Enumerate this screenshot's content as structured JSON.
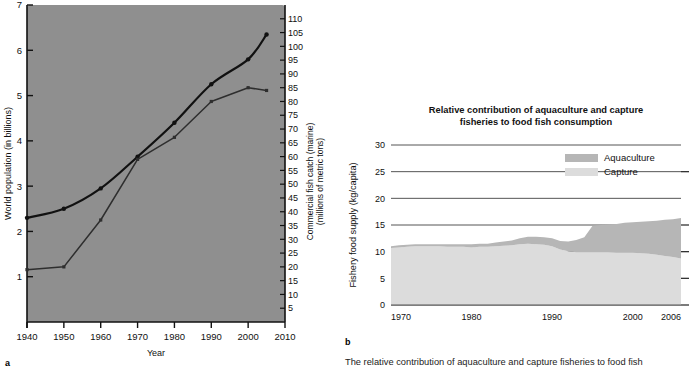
{
  "figure": {
    "panel_a_letter": "a",
    "panel_b_letter": "b",
    "caption": "The relative contribution of aquaculture and capture fisheries to food fish"
  },
  "chart_data": [
    {
      "id": "panel-a",
      "type": "line",
      "title": "",
      "xlabel": "Year",
      "ylabel": "World population (in billions)",
      "y2label": "Commercial fish catch (marine) (millions of metric tons)",
      "xlim": [
        1940,
        2010
      ],
      "ylim": [
        0,
        7
      ],
      "y2lim": [
        0,
        115
      ],
      "xticks": [
        1940,
        1950,
        1960,
        1970,
        1980,
        1990,
        2000,
        2010
      ],
      "yticks": [
        1,
        2,
        3,
        4,
        5,
        6,
        7
      ],
      "y2ticks": [
        5,
        10,
        15,
        20,
        25,
        30,
        35,
        40,
        45,
        50,
        55,
        60,
        65,
        70,
        75,
        80,
        85,
        90,
        95,
        100,
        105,
        110
      ],
      "grid": false,
      "legend": "none",
      "plot_background": "#8f8f8f",
      "series": [
        {
          "name": "World population",
          "axis": "left",
          "color": "#111111",
          "x": [
            1940,
            1950,
            1960,
            1970,
            1980,
            1990,
            2000,
            2005
          ],
          "values": [
            2.3,
            2.5,
            2.95,
            3.65,
            4.4,
            5.25,
            5.8,
            6.35
          ]
        },
        {
          "name": "Commercial fish catch (marine)",
          "axis": "right",
          "color": "#2e2e2e",
          "x": [
            1940,
            1950,
            1960,
            1970,
            1980,
            1990,
            2000,
            2005
          ],
          "values": [
            19,
            20,
            37,
            59,
            67,
            80,
            85,
            84
          ]
        }
      ]
    },
    {
      "id": "panel-b",
      "type": "area",
      "title": "Relative contribution of aquaculture and capture fisheries to food fish consumption",
      "xlabel": "",
      "ylabel": "Fishery food supply (kg/capita)",
      "xlim": [
        1970,
        2006
      ],
      "ylim": [
        0,
        30
      ],
      "xticks": [
        1970,
        1980,
        1990,
        2000,
        2006
      ],
      "yticks": [
        0,
        5,
        10,
        15,
        20,
        25,
        30
      ],
      "grid": true,
      "legend": "inside-top-right",
      "stacked": true,
      "x": [
        1970,
        1971,
        1972,
        1973,
        1974,
        1975,
        1976,
        1977,
        1978,
        1979,
        1980,
        1981,
        1982,
        1983,
        1984,
        1985,
        1986,
        1987,
        1988,
        1989,
        1990,
        1991,
        1992,
        1993,
        1994,
        1995,
        1996,
        1997,
        1998,
        1999,
        2000,
        2001,
        2002,
        2003,
        2004,
        2005,
        2006
      ],
      "series": [
        {
          "name": "Capture",
          "color": "#dcdcdc",
          "values": [
            10.7,
            10.8,
            10.9,
            11.0,
            11.0,
            11.0,
            11.0,
            10.9,
            10.9,
            10.9,
            10.8,
            10.9,
            10.9,
            11.0,
            11.1,
            11.2,
            11.4,
            11.5,
            11.4,
            11.3,
            11.0,
            10.4,
            10.1,
            9.9,
            9.9,
            9.9,
            9.9,
            9.9,
            9.8,
            9.8,
            9.8,
            9.7,
            9.6,
            9.4,
            9.2,
            9.0,
            8.7
          ]
        },
        {
          "name": "Aquaculture",
          "color": "#b6b6b6",
          "values": [
            0.3,
            0.4,
            0.4,
            0.4,
            0.4,
            0.4,
            0.4,
            0.5,
            0.5,
            0.5,
            0.6,
            0.6,
            0.6,
            0.7,
            0.8,
            0.9,
            1.1,
            1.3,
            1.4,
            1.4,
            1.5,
            1.6,
            1.8,
            2.3,
            2.8,
            4.9,
            5.1,
            5.2,
            5.4,
            5.6,
            5.7,
            5.9,
            6.1,
            6.4,
            6.8,
            7.1,
            7.6
          ]
        }
      ]
    }
  ],
  "panel_a": {
    "xlabel": "Year",
    "ylabel_left": "World population (in billions)",
    "ylabel_right_1": "Commercial fish catch (marine)",
    "ylabel_right_2": "(millions of metric tons)"
  },
  "panel_b": {
    "title_line1": "Relative contribution of aquaculture and capture",
    "title_line2": "fisheries to food fish consumption",
    "ylabel": "Fishery food supply (kg/capita)",
    "legend": [
      {
        "label": "Aquaculture",
        "color": "#b6b6b6"
      },
      {
        "label": "Capture",
        "color": "#dcdcdc"
      }
    ]
  }
}
